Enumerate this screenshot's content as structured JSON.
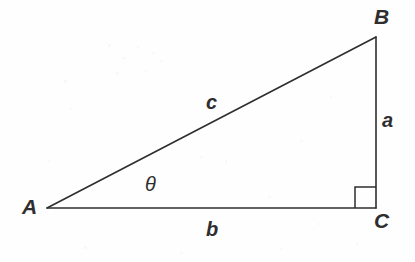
{
  "figure": {
    "type": "right-triangle-diagram",
    "background_color": "#fefefe",
    "stroke_color": "#2e2e2e",
    "stroke_width": 1.6,
    "width": 415,
    "height": 262
  },
  "vertices": {
    "A": {
      "label": "A",
      "x": 47,
      "y": 208,
      "label_x": 22,
      "label_y": 196
    },
    "B": {
      "label": "B",
      "x": 376,
      "y": 37,
      "label_x": 374,
      "label_y": 6
    },
    "C": {
      "label": "C",
      "x": 376,
      "y": 208,
      "label_x": 374,
      "label_y": 210
    }
  },
  "sides": {
    "a": {
      "label": "a",
      "from": "B",
      "to": "C",
      "label_x": 382,
      "label_y": 110
    },
    "b": {
      "label": "b",
      "from": "A",
      "to": "C",
      "label_x": 206,
      "label_y": 219
    },
    "c": {
      "label": "c",
      "from": "A",
      "to": "B",
      "label_x": 206,
      "label_y": 92
    }
  },
  "angles": {
    "theta": {
      "label": "θ",
      "at_vertex": "A",
      "label_x": 145,
      "label_y": 174
    },
    "right_angle": {
      "at_vertex": "C",
      "marker": "square",
      "size": 21,
      "marker_x": 355,
      "marker_y": 187
    }
  },
  "geometry_paths": {
    "hypotenuse": "M 47 208 L 376 37",
    "vertical_leg": "M 376 37 L 376 208",
    "base_leg": "M 47 208 L 376 208",
    "right_angle_marker": "M 355 208 L 355 187 L 376 187"
  },
  "speckles": [
    {
      "x": 108,
      "y": 44,
      "w": 3,
      "h": 3
    },
    {
      "x": 122,
      "y": 57,
      "w": 4,
      "h": 2
    },
    {
      "x": 137,
      "y": 46,
      "w": 2,
      "h": 3
    },
    {
      "x": 152,
      "y": 52,
      "w": 3,
      "h": 2
    },
    {
      "x": 116,
      "y": 72,
      "w": 3,
      "h": 3
    },
    {
      "x": 145,
      "y": 70,
      "w": 2,
      "h": 2
    },
    {
      "x": 160,
      "y": 60,
      "w": 3,
      "h": 2
    },
    {
      "x": 64,
      "y": 80,
      "w": 3,
      "h": 3
    },
    {
      "x": 70,
      "y": 108,
      "w": 2,
      "h": 2
    },
    {
      "x": 200,
      "y": 156,
      "w": 3,
      "h": 2
    },
    {
      "x": 225,
      "y": 160,
      "w": 2,
      "h": 3
    },
    {
      "x": 300,
      "y": 140,
      "w": 3,
      "h": 2
    },
    {
      "x": 330,
      "y": 96,
      "w": 2,
      "h": 2
    },
    {
      "x": 84,
      "y": 246,
      "w": 3,
      "h": 3
    },
    {
      "x": 280,
      "y": 248,
      "w": 2,
      "h": 2
    },
    {
      "x": 180,
      "y": 252,
      "w": 3,
      "h": 2
    },
    {
      "x": 356,
      "y": 243,
      "w": 2,
      "h": 3
    },
    {
      "x": 48,
      "y": 160,
      "w": 2,
      "h": 2
    },
    {
      "x": 268,
      "y": 196,
      "w": 3,
      "h": 2
    },
    {
      "x": 318,
      "y": 223,
      "w": 2,
      "h": 2
    }
  ]
}
